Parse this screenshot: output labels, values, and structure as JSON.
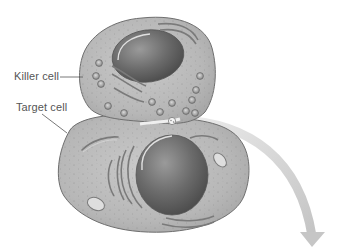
{
  "diagram": {
    "labels": {
      "killer_cell": "Killer cell",
      "target_cell": "Target cell"
    },
    "elements": {
      "killer_cell": {
        "type": "cell",
        "role": "cytotoxic killer cell",
        "contains": [
          "nucleus",
          "granules",
          "membranes"
        ]
      },
      "target_cell": {
        "type": "cell",
        "role": "target cell",
        "contains": [
          "nucleus",
          "endoplasmic-reticulum",
          "mitochondrion"
        ]
      },
      "contact_point": {
        "type": "granule-release",
        "description": "granule released at cell contact"
      },
      "arrow": {
        "type": "curved-arrow",
        "direction": "down-right"
      }
    },
    "colors": {
      "cell_fill": "#b9b9b9",
      "cell_outline": "#6e6e6e",
      "nucleus": "#6a6a6a",
      "arrow": "#cfcfcf",
      "label_text": "#555555",
      "leader_line": "#555555"
    }
  }
}
